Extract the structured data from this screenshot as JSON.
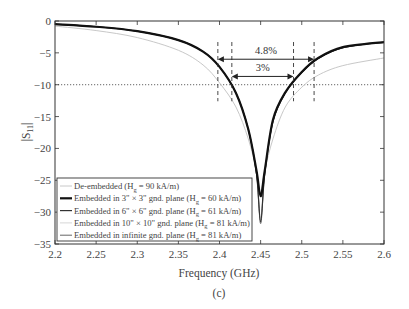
{
  "chart_data": {
    "type": "line",
    "title": "",
    "caption": "(c)",
    "xlabel": "Frequency (GHz)",
    "ylabel": "|S11|",
    "xlim": [
      2.2,
      2.6
    ],
    "ylim": [
      -35,
      0
    ],
    "xticks": [
      2.2,
      2.25,
      2.3,
      2.35,
      2.4,
      2.45,
      2.5,
      2.55,
      2.6
    ],
    "xtick_labels": [
      "2.2",
      "2.25",
      "2.3",
      "2.35",
      "2.4",
      "2.45",
      "2.5",
      "2.55",
      "2.6"
    ],
    "yticks": [
      0,
      -5,
      -10,
      -15,
      -20,
      -25,
      -30,
      -35
    ],
    "ytick_labels": [
      "0",
      "-5",
      "-10",
      "-15",
      "-20",
      "-25",
      "-30",
      "-35"
    ],
    "grid": false,
    "reference_line": {
      "y": -10,
      "style": "dotted"
    },
    "legend_position": "lower left",
    "series": [
      {
        "name": "De-embedded (Hg = 90 kA/m)",
        "color": "#c8c8c8",
        "width": 1.0,
        "x": [
          2.2,
          2.25,
          2.3,
          2.35,
          2.38,
          2.4,
          2.42,
          2.435,
          2.445,
          2.45,
          2.455,
          2.465,
          2.48,
          2.5,
          2.52,
          2.55,
          2.6
        ],
        "y": [
          -0.8,
          -1.5,
          -2.6,
          -4.6,
          -6.9,
          -9.7,
          -13.5,
          -18.5,
          -23.5,
          -27.0,
          -23.5,
          -18.5,
          -13.5,
          -10.4,
          -8.5,
          -7.0,
          -5.8
        ]
      },
      {
        "name": "Embedded in 3\" × 3\" gnd. plane (Hg = 60 kA/m)",
        "color": "#111111",
        "width": 2.2,
        "x": [
          2.2,
          2.25,
          2.3,
          2.35,
          2.38,
          2.4,
          2.42,
          2.435,
          2.445,
          2.45,
          2.455,
          2.465,
          2.48,
          2.5,
          2.52,
          2.55,
          2.6
        ],
        "y": [
          -0.5,
          -0.9,
          -1.6,
          -3.0,
          -4.8,
          -7.2,
          -11.3,
          -17.0,
          -23.5,
          -27.5,
          -23.5,
          -15.5,
          -11.2,
          -8.0,
          -5.8,
          -4.1,
          -3.3
        ]
      },
      {
        "name": "Embedded in 6\" × 6\" gnd. plane (Hg = 61 kA/m)",
        "color": "#333333",
        "width": 1.2,
        "x": [
          2.2,
          2.25,
          2.3,
          2.35,
          2.38,
          2.4,
          2.42,
          2.435,
          2.445,
          2.45,
          2.455,
          2.465,
          2.48,
          2.5,
          2.52,
          2.55,
          2.6
        ],
        "y": [
          -0.5,
          -0.9,
          -1.6,
          -3.0,
          -4.8,
          -7.2,
          -11.3,
          -17.0,
          -24.0,
          -31.5,
          -24.0,
          -15.8,
          -11.3,
          -8.1,
          -5.9,
          -4.2,
          -3.3
        ]
      },
      {
        "name": "Embedded in 10\" × 10\" gnd. plane (Hg = 81 kA/m)",
        "color": "#d6d6d6",
        "width": 1.0,
        "x": [
          2.2,
          2.25,
          2.3,
          2.35,
          2.38,
          2.4,
          2.42,
          2.435,
          2.445,
          2.45,
          2.455,
          2.465,
          2.48,
          2.5,
          2.52,
          2.55,
          2.6
        ],
        "y": [
          -0.5,
          -0.9,
          -1.6,
          -3.0,
          -4.8,
          -7.2,
          -11.3,
          -17.0,
          -24.0,
          -31.0,
          -24.0,
          -15.8,
          -11.3,
          -8.1,
          -5.9,
          -4.2,
          -3.3
        ]
      },
      {
        "name": "Embedded in infinite gnd. plane (Hg = 81 kA/m)",
        "color": "#666666",
        "width": 1.0,
        "x": [
          2.2,
          2.25,
          2.3,
          2.35,
          2.38,
          2.4,
          2.42,
          2.435,
          2.445,
          2.45,
          2.455,
          2.465,
          2.48,
          2.5,
          2.52,
          2.55,
          2.6
        ],
        "y": [
          -0.5,
          -0.9,
          -1.6,
          -3.0,
          -4.8,
          -7.2,
          -11.3,
          -17.0,
          -24.0,
          -31.8,
          -24.0,
          -15.8,
          -11.3,
          -8.1,
          -5.9,
          -4.2,
          -3.3
        ]
      }
    ],
    "annotations": [
      {
        "text": "4.8%",
        "type": "bandwidth-arrow",
        "x_start": 2.398,
        "x_end": 2.515,
        "y": -6.0
      },
      {
        "text": "3%",
        "type": "bandwidth-arrow",
        "x_start": 2.415,
        "x_end": 2.49,
        "y": -8.7
      }
    ],
    "bandwidth_markers_x": [
      2.398,
      2.415,
      2.49,
      2.515
    ]
  },
  "legend": {
    "items": [
      {
        "prefix": "De-embedded (H",
        "sub": "g",
        "suffix": " = 90 kA/m)"
      },
      {
        "prefix": "Embedded in 3\" × 3\" gnd. plane (H",
        "sub": "g",
        "suffix": " = 60 kA/m)"
      },
      {
        "prefix": "Embedded in 6\" × 6\" gnd. plane (H",
        "sub": "g",
        "suffix": " = 61 kA/m)"
      },
      {
        "prefix": "Embedded in 10\" × 10\" gnd. plane (H",
        "sub": "g",
        "suffix": " = 81 kA/m)"
      },
      {
        "prefix": "Embedded in infinite gnd. plane (H",
        "sub": "g",
        "suffix": " = 81 kA/m)"
      }
    ]
  },
  "labels": {
    "xlabel": "Frequency (GHz)",
    "ylabel_main": "|S",
    "ylabel_sub": "11",
    "ylabel_end": "|",
    "caption": "(c)",
    "annot_wide": "4.8%",
    "annot_narrow": "3%"
  }
}
